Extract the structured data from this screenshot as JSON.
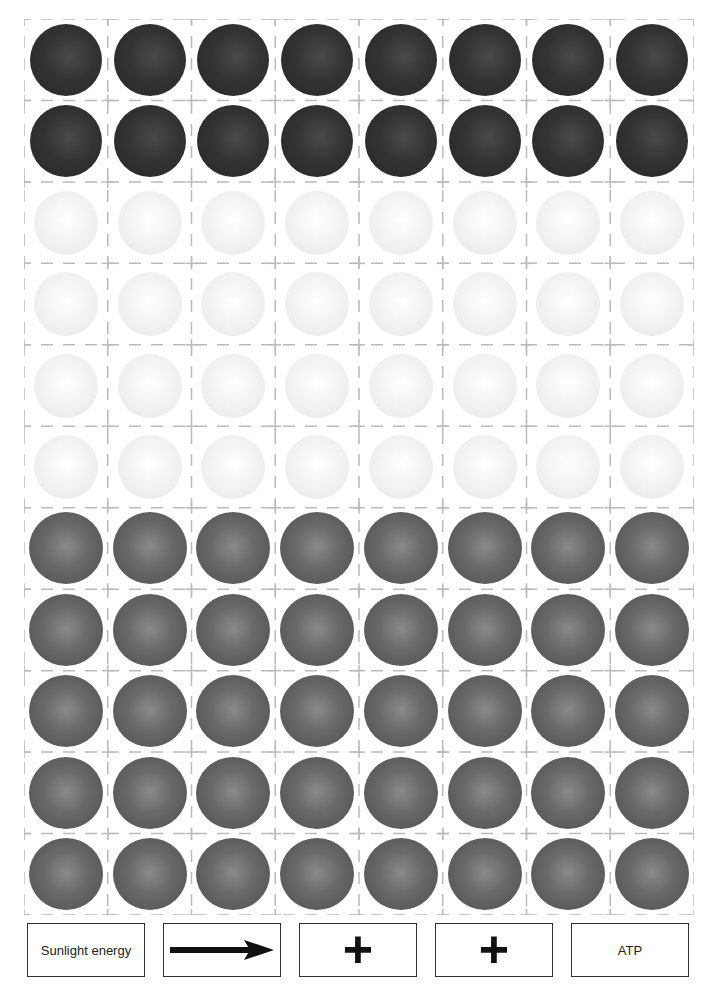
{
  "worksheet": {
    "grid": {
      "columns": 8,
      "rows": [
        {
          "type": "dark",
          "color": "#2e2e2e"
        },
        {
          "type": "dark",
          "color": "#2e2e2e"
        },
        {
          "type": "light",
          "color": "#f0f0f0"
        },
        {
          "type": "light",
          "color": "#f0f0f0"
        },
        {
          "type": "light",
          "color": "#f0f0f0"
        },
        {
          "type": "light",
          "color": "#f0f0f0"
        },
        {
          "type": "medium",
          "color": "#666666"
        },
        {
          "type": "medium",
          "color": "#666666"
        },
        {
          "type": "medium",
          "color": "#666666"
        },
        {
          "type": "medium",
          "color": "#666666"
        },
        {
          "type": "medium",
          "color": "#666666"
        }
      ],
      "cut_line_color": "#bbbbbb"
    },
    "cards": [
      {
        "id": "sunlight",
        "text": "Sunlight energy",
        "icon": null
      },
      {
        "id": "arrow",
        "text": "",
        "icon": "arrow-right-icon"
      },
      {
        "id": "plus1",
        "text": "+",
        "icon": "plus-icon"
      },
      {
        "id": "plus2",
        "text": "+",
        "icon": "plus-icon"
      },
      {
        "id": "atp",
        "text": "ATP",
        "icon": null
      }
    ]
  }
}
